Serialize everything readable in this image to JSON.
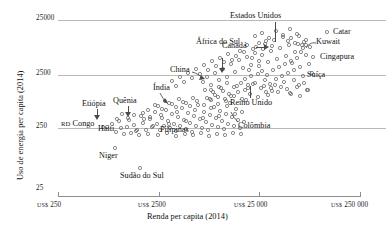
{
  "chart_data": {
    "type": "scatter",
    "title": "",
    "xlabel": "Renda per capita (2014)",
    "ylabel": "Uso de energia per capita (2014)",
    "xscale": "log",
    "yscale": "log",
    "grid": true,
    "legend": "none",
    "xticks": [
      {
        "value": 250,
        "label": "US$ 250",
        "currency": "US$",
        "number": "250"
      },
      {
        "value": 2500,
        "label": "US$ 2500",
        "currency": "US$",
        "number": "2500"
      },
      {
        "value": 25000,
        "label": "US$ 25 000",
        "currency": "US$",
        "number": "25 000"
      },
      {
        "value": 250000,
        "label": "US$ 250 000",
        "currency": "US$",
        "number": "250 000"
      }
    ],
    "yticks": [
      {
        "value": 25000,
        "label": "25000"
      },
      {
        "value": 2500,
        "label": "2500"
      },
      {
        "value": 250,
        "label": "250"
      },
      {
        "value": 25,
        "label": "25"
      }
    ],
    "xlim": [
      250,
      250000
    ],
    "ylim": [
      25,
      25000
    ],
    "annotations": [
      {
        "name": "estados-unidos",
        "label": "Estados Unidos",
        "x": 52000,
        "y": 6900
      },
      {
        "name": "catar",
        "label": "Catar",
        "x": 135000,
        "y": 16500
      },
      {
        "name": "kuwait",
        "label": "Kuwait",
        "x": 83000,
        "y": 9500
      },
      {
        "name": "cingapura",
        "label": "Cingapura",
        "x": 86000,
        "y": 5200
      },
      {
        "name": "suica",
        "label": "Suíça",
        "x": 62000,
        "y": 3200
      },
      {
        "name": "canada",
        "label": "Canadá",
        "x": 43000,
        "y": 7800
      },
      {
        "name": "africa-do-sul",
        "label": "África do Sul",
        "x": 12000,
        "y": 2700
      },
      {
        "name": "china",
        "label": "China",
        "x": 7500,
        "y": 2200
      },
      {
        "name": "reino-unido",
        "label": "Reino Unido",
        "x": 41000,
        "y": 3000
      },
      {
        "name": "colombia",
        "label": "Colômbia",
        "x": 7500,
        "y": 700
      },
      {
        "name": "india",
        "label": "Índia",
        "x": 1600,
        "y": 640
      },
      {
        "name": "quenia",
        "label": "Quênia",
        "x": 1300,
        "y": 480
      },
      {
        "name": "etiopia",
        "label": "Etiópia",
        "x": 600,
        "y": 420
      },
      {
        "name": "haiti",
        "label": "Haiti",
        "x": 1700,
        "y": 380
      },
      {
        "name": "filipinas",
        "label": "Filipinas",
        "x": 3100,
        "y": 470
      },
      {
        "name": "rd-congo",
        "label": "RD Congo",
        "x": 430,
        "y": 290,
        "smallcaps": "RD"
      },
      {
        "name": "niger",
        "label": "Niger",
        "x": 900,
        "y": 110
      },
      {
        "name": "sudao-do-sul",
        "label": "Sudão do Sul",
        "x": 1500,
        "y": 60
      }
    ],
    "points": [
      [
        103,
        127
      ],
      [
        119,
        121
      ],
      [
        127,
        127
      ],
      [
        134,
        125
      ],
      [
        137,
        130
      ],
      [
        141,
        116
      ],
      [
        143,
        123
      ],
      [
        146,
        130
      ],
      [
        150,
        119
      ],
      [
        152,
        127
      ],
      [
        155,
        112
      ],
      [
        157,
        124
      ],
      [
        160,
        130
      ],
      [
        162,
        118
      ],
      [
        164,
        126
      ],
      [
        166,
        110
      ],
      [
        168,
        121
      ],
      [
        170,
        128
      ],
      [
        172,
        114
      ],
      [
        174,
        124
      ],
      [
        176,
        131
      ],
      [
        178,
        117
      ],
      [
        180,
        126
      ],
      [
        182,
        108
      ],
      [
        184,
        120
      ],
      [
        186,
        129
      ],
      [
        188,
        113
      ],
      [
        190,
        123
      ],
      [
        192,
        132
      ],
      [
        194,
        116
      ],
      [
        196,
        126
      ],
      [
        198,
        105
      ],
      [
        200,
        119
      ],
      [
        202,
        128
      ],
      [
        204,
        112
      ],
      [
        206,
        122
      ],
      [
        208,
        130
      ],
      [
        210,
        115
      ],
      [
        212,
        125
      ],
      [
        214,
        107
      ],
      [
        216,
        118
      ],
      [
        218,
        127
      ],
      [
        220,
        111
      ],
      [
        222,
        121
      ],
      [
        224,
        129
      ],
      [
        226,
        114
      ],
      [
        228,
        124
      ],
      [
        230,
        103
      ],
      [
        232,
        117
      ],
      [
        234,
        126
      ],
      [
        236,
        109
      ],
      [
        238,
        120
      ],
      [
        240,
        128
      ],
      [
        242,
        112
      ],
      [
        244,
        122
      ],
      [
        246,
        100
      ],
      [
        116,
        132
      ],
      [
        124,
        134
      ],
      [
        131,
        133
      ],
      [
        139,
        135
      ],
      [
        148,
        134
      ],
      [
        158,
        135
      ],
      [
        167,
        133
      ],
      [
        176,
        136
      ],
      [
        185,
        134
      ],
      [
        193,
        135
      ],
      [
        201,
        133
      ],
      [
        209,
        136
      ],
      [
        217,
        134
      ],
      [
        225,
        135
      ],
      [
        233,
        133
      ],
      [
        241,
        134
      ],
      [
        112,
        124
      ],
      [
        121,
        128
      ],
      [
        129,
        120
      ],
      [
        136,
        131
      ],
      [
        144,
        119
      ],
      [
        153,
        126
      ],
      [
        161,
        115
      ],
      [
        169,
        124
      ],
      [
        177,
        112
      ],
      [
        186,
        121
      ],
      [
        195,
        110
      ],
      [
        203,
        118
      ],
      [
        211,
        108
      ],
      [
        219,
        116
      ],
      [
        227,
        106
      ],
      [
        235,
        114
      ],
      [
        115,
        148
      ],
      [
        140,
        168
      ],
      [
        107,
        127
      ],
      [
        203,
        82
      ],
      [
        207,
        77
      ],
      [
        211,
        85
      ],
      [
        215,
        73
      ],
      [
        219,
        80
      ],
      [
        223,
        69
      ],
      [
        227,
        77
      ],
      [
        231,
        64
      ],
      [
        235,
        72
      ],
      [
        239,
        60
      ],
      [
        243,
        68
      ],
      [
        247,
        57
      ],
      [
        251,
        65
      ],
      [
        255,
        53
      ],
      [
        259,
        61
      ],
      [
        263,
        49
      ],
      [
        205,
        90
      ],
      [
        213,
        92
      ],
      [
        221,
        88
      ],
      [
        229,
        94
      ],
      [
        237,
        86
      ],
      [
        245,
        90
      ],
      [
        253,
        84
      ],
      [
        261,
        88
      ],
      [
        210,
        99
      ],
      [
        218,
        97
      ],
      [
        226,
        101
      ],
      [
        234,
        96
      ],
      [
        242,
        99
      ],
      [
        250,
        94
      ],
      [
        258,
        97
      ],
      [
        266,
        92
      ],
      [
        249,
        70
      ],
      [
        252,
        58
      ],
      [
        256,
        47
      ],
      [
        259,
        66
      ],
      [
        262,
        55
      ],
      [
        265,
        44
      ],
      [
        268,
        62
      ],
      [
        271,
        51
      ],
      [
        274,
        40
      ],
      [
        277,
        59
      ],
      [
        280,
        48
      ],
      [
        283,
        37
      ],
      [
        286,
        56
      ],
      [
        289,
        45
      ],
      [
        292,
        63
      ],
      [
        295,
        52
      ],
      [
        267,
        75
      ],
      [
        270,
        84
      ],
      [
        273,
        70
      ],
      [
        276,
        79
      ],
      [
        279,
        67
      ],
      [
        282,
        76
      ],
      [
        285,
        64
      ],
      [
        288,
        73
      ],
      [
        291,
        61
      ],
      [
        294,
        70
      ],
      [
        297,
        58
      ],
      [
        300,
        67
      ],
      [
        303,
        76
      ],
      [
        306,
        55
      ],
      [
        309,
        64
      ],
      [
        312,
        73
      ],
      [
        264,
        86
      ],
      [
        272,
        91
      ],
      [
        281,
        87
      ],
      [
        290,
        93
      ],
      [
        299,
        85
      ],
      [
        308,
        90
      ],
      [
        255,
        36
      ],
      [
        262,
        33
      ],
      [
        269,
        38
      ],
      [
        276,
        31
      ],
      [
        283,
        35
      ],
      [
        290,
        29
      ],
      [
        297,
        34
      ],
      [
        304,
        42
      ],
      [
        288,
        41
      ],
      [
        291,
        38
      ],
      [
        295,
        43
      ],
      [
        299,
        36
      ],
      [
        302,
        45
      ],
      [
        306,
        40
      ],
      [
        310,
        47
      ],
      [
        327,
        32
      ],
      [
        313,
        57
      ],
      [
        306,
        45
      ],
      [
        303,
        48
      ],
      [
        301,
        52
      ],
      [
        298,
        44
      ],
      [
        266,
        41
      ],
      [
        272,
        46
      ],
      [
        259,
        43
      ],
      [
        253,
        49
      ],
      [
        247,
        45
      ],
      [
        244,
        52
      ],
      [
        236,
        56
      ],
      [
        240,
        51
      ],
      [
        232,
        60
      ],
      [
        228,
        54
      ],
      [
        224,
        62
      ],
      [
        220,
        58
      ],
      [
        216,
        66
      ],
      [
        212,
        61
      ],
      [
        208,
        70
      ],
      [
        204,
        65
      ],
      [
        200,
        74
      ],
      [
        196,
        69
      ],
      [
        192,
        78
      ],
      [
        188,
        73
      ],
      [
        184,
        82
      ],
      [
        180,
        77
      ],
      [
        176,
        86
      ],
      [
        172,
        81
      ],
      [
        245,
        79
      ],
      [
        248,
        88
      ],
      [
        241,
        83
      ],
      [
        238,
        92
      ],
      [
        234,
        87
      ],
      [
        231,
        96
      ],
      [
        227,
        83
      ],
      [
        223,
        91
      ],
      [
        219,
        87
      ],
      [
        215,
        95
      ],
      [
        211,
        90
      ],
      [
        207,
        98
      ],
      [
        262,
        71
      ],
      [
        265,
        80
      ],
      [
        258,
        74
      ],
      [
        255,
        83
      ],
      [
        251,
        76
      ],
      [
        248,
        85
      ],
      [
        275,
        85
      ],
      [
        278,
        92
      ],
      [
        271,
        88
      ],
      [
        268,
        95
      ],
      [
        284,
        82
      ],
      [
        287,
        89
      ],
      [
        294,
        80
      ],
      [
        297,
        87
      ],
      [
        291,
        94
      ],
      [
        304,
        83
      ],
      [
        307,
        90
      ],
      [
        300,
        96
      ],
      [
        158,
        106
      ],
      [
        165,
        101
      ],
      [
        172,
        104
      ],
      [
        179,
        99
      ],
      [
        186,
        103
      ],
      [
        193,
        98
      ],
      [
        148,
        110
      ],
      [
        155,
        105
      ],
      [
        162,
        109
      ],
      [
        169,
        103
      ],
      [
        176,
        107
      ],
      [
        183,
        102
      ],
      [
        190,
        106
      ],
      [
        197,
        101
      ],
      [
        204,
        105
      ],
      [
        211,
        100
      ],
      [
        218,
        104
      ],
      [
        225,
        99
      ],
      [
        143,
        113
      ],
      [
        150,
        117
      ],
      [
        134,
        115
      ],
      [
        128,
        118
      ],
      [
        122,
        114
      ],
      [
        117,
        119
      ]
    ]
  }
}
